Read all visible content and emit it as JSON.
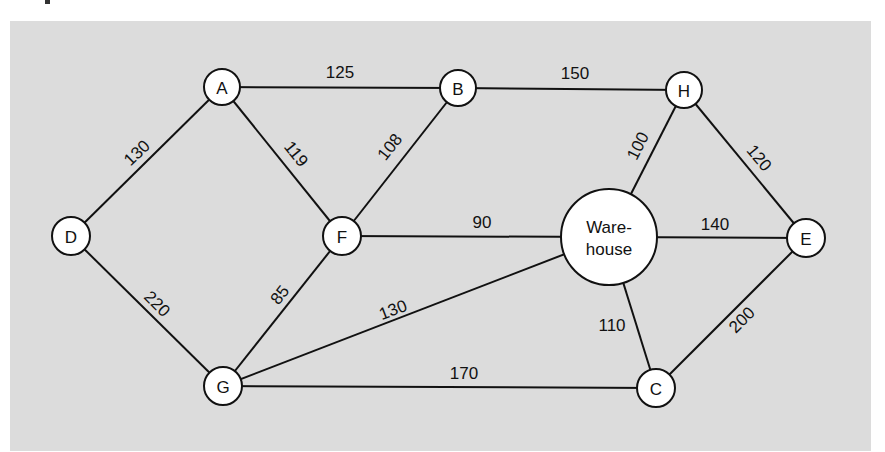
{
  "diagram": {
    "type": "weighted-undirected-graph",
    "colors": {
      "panel_background": "#dcdcdc",
      "node_fill": "#ffffff",
      "stroke": "#111111"
    },
    "nodes": [
      {
        "id": "A",
        "label": "A",
        "x": 222,
        "y": 87,
        "r": 18
      },
      {
        "id": "B",
        "label": "B",
        "x": 458,
        "y": 88,
        "r": 18
      },
      {
        "id": "H",
        "label": "H",
        "x": 684,
        "y": 90,
        "r": 18
      },
      {
        "id": "D",
        "label": "D",
        "x": 71,
        "y": 236,
        "r": 19
      },
      {
        "id": "F",
        "label": "F",
        "x": 342,
        "y": 236,
        "r": 19
      },
      {
        "id": "W",
        "label_line1": "Ware-",
        "label_line2": "house",
        "x": 609,
        "y": 237,
        "r": 48
      },
      {
        "id": "E",
        "label": "E",
        "x": 806,
        "y": 238,
        "r": 19
      },
      {
        "id": "G",
        "label": "G",
        "x": 223,
        "y": 386,
        "r": 19
      },
      {
        "id": "C",
        "label": "C",
        "x": 656,
        "y": 388,
        "r": 19
      }
    ],
    "edges": [
      {
        "from": "A",
        "to": "B",
        "weight": "125"
      },
      {
        "from": "B",
        "to": "H",
        "weight": "150"
      },
      {
        "from": "D",
        "to": "A",
        "weight": "130"
      },
      {
        "from": "A",
        "to": "F",
        "weight": "119"
      },
      {
        "from": "F",
        "to": "B",
        "weight": "108"
      },
      {
        "from": "W",
        "to": "H",
        "weight": "100"
      },
      {
        "from": "H",
        "to": "E",
        "weight": "120"
      },
      {
        "from": "F",
        "to": "W",
        "weight": "90"
      },
      {
        "from": "W",
        "to": "E",
        "weight": "140"
      },
      {
        "from": "D",
        "to": "G",
        "weight": "220"
      },
      {
        "from": "G",
        "to": "F",
        "weight": "85"
      },
      {
        "from": "G",
        "to": "W",
        "weight": "130"
      },
      {
        "from": "W",
        "to": "C",
        "weight": "110"
      },
      {
        "from": "C",
        "to": "E",
        "weight": "200"
      },
      {
        "from": "G",
        "to": "C",
        "weight": "170"
      }
    ]
  }
}
